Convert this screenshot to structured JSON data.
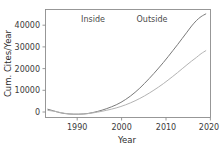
{
  "chart_data": {
    "type": "line",
    "title": "",
    "xlabel": "Year",
    "ylabel": "Cum. Cites/Year",
    "xlim": [
      1985,
      2020
    ],
    "ylim": [
      -2500,
      46000
    ],
    "grid": false,
    "legend_position": "none",
    "xticks": [
      1990,
      2000,
      2010,
      2020
    ],
    "xticklabels": [
      "1990",
      "2000",
      "2010",
      "2020"
    ],
    "yticks": [
      0,
      10000,
      20000,
      30000,
      40000
    ],
    "yticklabels": [
      "0",
      "10000",
      "20000",
      "30000",
      "40000"
    ],
    "annotations": [
      {
        "text": "Inside",
        "x": 1993.5,
        "y": 44500
      },
      {
        "text": "Outside",
        "x": 2006.5,
        "y": 44500
      }
    ],
    "series": [
      {
        "name": "upper-curve",
        "color": "#7a7a7a",
        "x": [
          1985.5,
          1987,
          1988,
          1989,
          1990,
          1991,
          1992,
          1993,
          1994,
          1995,
          1996,
          1997,
          1998,
          1999,
          2000,
          2001,
          2002,
          2003,
          2004,
          2005,
          2006,
          2007,
          2008,
          2009,
          2010,
          2011,
          2012,
          2013,
          2014,
          2015,
          2016,
          2017,
          2018,
          2019
        ],
        "y": [
          1200,
          300,
          -300,
          -700,
          -900,
          -1000,
          -1000,
          -900,
          -700,
          -300,
          200,
          800,
          1500,
          2300,
          3200,
          4300,
          5600,
          7100,
          8800,
          10700,
          12800,
          15000,
          17300,
          19700,
          22200,
          24800,
          27500,
          30200,
          33000,
          35800,
          38600,
          41000,
          42800,
          44000
        ]
      },
      {
        "name": "lower-curve",
        "color": "#b3b3b3",
        "x": [
          1985.5,
          1987,
          1988,
          1989,
          1990,
          1991,
          1992,
          1993,
          1994,
          1995,
          1996,
          1997,
          1998,
          1999,
          2000,
          2001,
          2002,
          2003,
          2004,
          2005,
          2006,
          2007,
          2008,
          2009,
          2010,
          2011,
          2012,
          2013,
          2014,
          2015,
          2016,
          2017,
          2018,
          2019
        ],
        "y": [
          700,
          250,
          -200,
          -600,
          -900,
          -1050,
          -1050,
          -950,
          -750,
          -450,
          -100,
          300,
          750,
          1250,
          1800,
          2450,
          3200,
          4050,
          5000,
          6050,
          7200,
          8450,
          9800,
          11200,
          12700,
          14300,
          15950,
          17650,
          19400,
          21150,
          22850,
          24450,
          26150,
          27500
        ]
      }
    ]
  }
}
